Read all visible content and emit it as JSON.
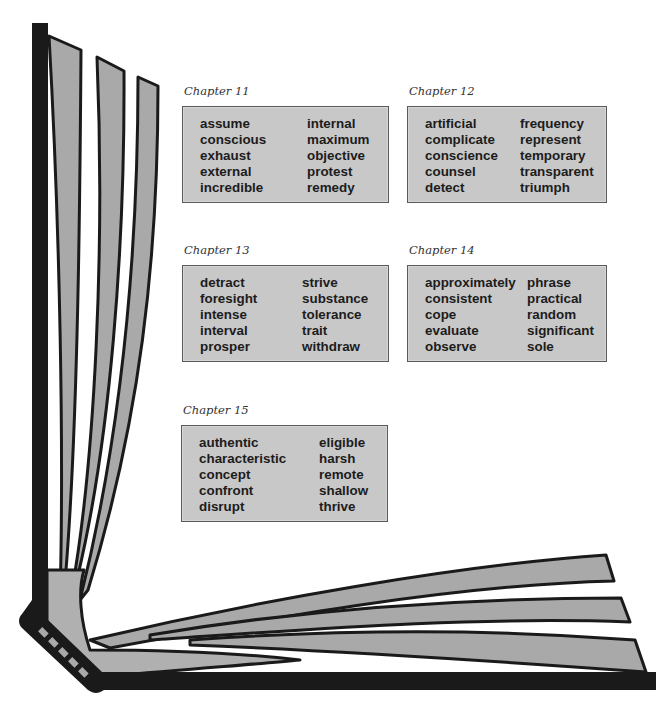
{
  "chapters": [
    {
      "label": "Chapter 11",
      "left_words": [
        "assume",
        "conscious",
        "exhaust",
        "external",
        "incredible"
      ],
      "right_words": [
        "internal",
        "maximum",
        "objective",
        "protest",
        "remedy"
      ]
    },
    {
      "label": "Chapter 12",
      "left_words": [
        "artificial",
        "complicate",
        "conscience",
        "counsel",
        "detect"
      ],
      "right_words": [
        "frequency",
        "represent",
        "temporary",
        "transparent",
        "triumph"
      ]
    },
    {
      "label": "Chapter 13",
      "left_words": [
        "detract",
        "foresight",
        "intense",
        "interval",
        "prosper"
      ],
      "right_words": [
        "strive",
        "substance",
        "tolerance",
        "trait",
        "withdraw"
      ]
    },
    {
      "label": "Chapter 14",
      "left_words": [
        "approximately",
        "consistent",
        "cope",
        "evaluate",
        "observe"
      ],
      "right_words": [
        "phrase",
        "practical",
        "random",
        "significant",
        "sole"
      ]
    },
    {
      "label": "Chapter 15",
      "left_words": [
        "authentic",
        "characteristic",
        "concept",
        "confront",
        "disrupt"
      ],
      "right_words": [
        "eligible",
        "harsh",
        "remote",
        "shallow",
        "thrive"
      ]
    }
  ],
  "colors": {
    "box_fill": "#c8c8c8",
    "page_fill": "#a9a9a9",
    "spine": "#1a1a1a",
    "text": "#1c1c1c"
  }
}
